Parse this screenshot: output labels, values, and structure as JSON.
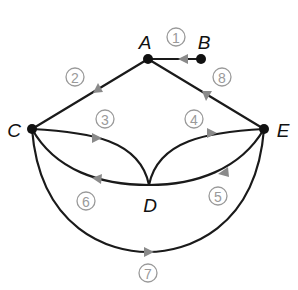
{
  "diagram": {
    "type": "directed multigraph",
    "colors": {
      "edge": "#1a1a1a",
      "arrow": "#8a8a8a",
      "node": "#111111",
      "edge_label": "#9a9a9a"
    },
    "vertices": [
      {
        "id": "A",
        "label": "A",
        "x": 148,
        "y": 59,
        "lx": 145,
        "ly": 42
      },
      {
        "id": "B",
        "label": "B",
        "x": 201,
        "y": 59,
        "lx": 204,
        "ly": 42
      },
      {
        "id": "C",
        "label": "C",
        "x": 32,
        "y": 129,
        "lx": 14,
        "ly": 130
      },
      {
        "id": "D",
        "label": "D",
        "x": 149,
        "y": 185,
        "lx": 150,
        "ly": 205
      },
      {
        "id": "E",
        "label": "E",
        "x": 264,
        "y": 129,
        "lx": 283,
        "ly": 130
      }
    ],
    "edges": [
      {
        "id": 1,
        "label": "1",
        "from": "B",
        "to": "A",
        "lx": 176,
        "ly": 37
      },
      {
        "id": 2,
        "label": "2",
        "from": "A",
        "to": "C",
        "lx": 75,
        "ly": 77
      },
      {
        "id": 3,
        "label": "3",
        "from": "C",
        "to": "D",
        "lx": 105,
        "ly": 119
      },
      {
        "id": 4,
        "label": "4",
        "from": "D",
        "to": "E",
        "lx": 194,
        "ly": 119
      },
      {
        "id": 5,
        "label": "5",
        "from": "E",
        "to": "D",
        "lx": 218,
        "ly": 196
      },
      {
        "id": 6,
        "label": "6",
        "from": "D",
        "to": "C",
        "lx": 86,
        "ly": 201
      },
      {
        "id": 7,
        "label": "7",
        "from": "C",
        "to": "E",
        "lx": 148,
        "ly": 273
      },
      {
        "id": 8,
        "label": "8",
        "from": "E",
        "to": "A",
        "lx": 222,
        "ly": 77
      }
    ]
  }
}
